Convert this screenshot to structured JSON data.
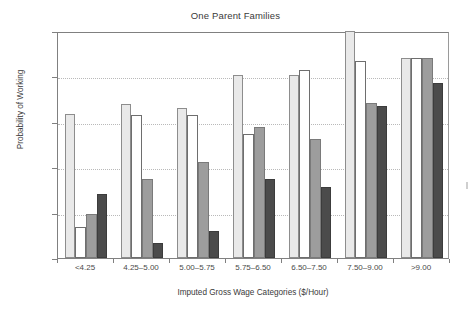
{
  "chart_data": {
    "type": "bar",
    "title": "One Parent Families",
    "xlabel": "Imputed Gross Wage Categories ($/Hour)",
    "ylabel": "Probability of Working",
    "categories": [
      "<4.25",
      "4.25–5.00",
      "5.00–5.75",
      "5.75–6.50",
      "6.50–7.50",
      "7.50–9.00",
      ">9.00"
    ],
    "ylim": [
      0,
      1
    ],
    "yticks": [
      0,
      0.2,
      0.4,
      0.6,
      0.8,
      1
    ],
    "ytick_labels": [
      "0",
      "0.2",
      "0.4",
      "0.6",
      "0.8",
      "1"
    ],
    "grid": "horizontal-dotted",
    "legend": "none",
    "series": [
      {
        "name": "series-1",
        "color": "#e9e9e9",
        "values": [
          0.635,
          0.68,
          0.66,
          0.805,
          0.805,
          1.0,
          0.88
        ]
      },
      {
        "name": "series-2",
        "color": "#ffffff",
        "values": [
          0.135,
          0.63,
          0.628,
          0.545,
          0.83,
          0.87,
          0.88
        ]
      },
      {
        "name": "series-3",
        "color": "#9d9d9d",
        "values": [
          0.195,
          0.35,
          0.425,
          0.578,
          0.525,
          0.685,
          0.88
        ]
      },
      {
        "name": "series-4",
        "color": "#4b4b4b",
        "values": [
          0.28,
          0.065,
          0.12,
          0.35,
          0.315,
          0.67,
          0.77
        ]
      }
    ]
  }
}
